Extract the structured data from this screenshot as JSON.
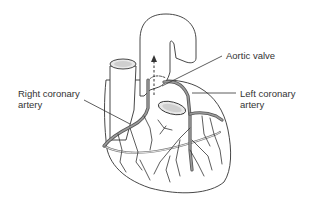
{
  "figure": {
    "labels": {
      "aortic_valve": "Aortic valve",
      "left_coronary_line1": "Left coronary",
      "left_coronary_line2": "artery",
      "right_coronary_line1": "Right coronary",
      "right_coronary_line2": "artery"
    },
    "colors": {
      "outline": "#333333",
      "artery": "#555555",
      "text": "#333333",
      "background": "#ffffff"
    },
    "annotations": {
      "flow_arrow": "dashed-up-arrow"
    }
  }
}
